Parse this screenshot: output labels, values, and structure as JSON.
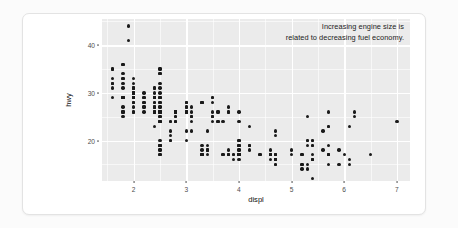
{
  "chart_data": {
    "type": "scatter",
    "title": "",
    "xlabel": "displ",
    "ylabel": "hwy",
    "xlim": [
      1.4,
      7.25
    ],
    "ylim": [
      11.5,
      45.5
    ],
    "xticks": [
      2,
      3,
      4,
      5,
      6,
      7
    ],
    "yticks": [
      20,
      30,
      40
    ],
    "xtick_labels": [
      "2",
      "3",
      "4",
      "5",
      "6",
      "7"
    ],
    "ytick_labels": [
      "20",
      "30",
      "40"
    ],
    "grid": true,
    "grid_major_color": "#ffffff",
    "panel_color": "#ebebeb",
    "point_color": "#1a1a1a",
    "legend": "none",
    "annotations": [
      {
        "text_line1": "Increasing engine size is",
        "text_line2": "related to decreasing fuel economy.",
        "position": "top-right"
      }
    ],
    "points": [
      [
        1.8,
        29
      ],
      [
        1.8,
        29
      ],
      [
        2.0,
        31
      ],
      [
        2.0,
        30
      ],
      [
        2.8,
        26
      ],
      [
        2.8,
        26
      ],
      [
        3.1,
        27
      ],
      [
        1.8,
        26
      ],
      [
        1.8,
        25
      ],
      [
        2.0,
        28
      ],
      [
        2.0,
        27
      ],
      [
        2.8,
        25
      ],
      [
        2.8,
        25
      ],
      [
        3.1,
        25
      ],
      [
        3.1,
        25
      ],
      [
        2.8,
        24
      ],
      [
        3.1,
        25
      ],
      [
        4.2,
        23
      ],
      [
        5.3,
        20
      ],
      [
        5.3,
        15
      ],
      [
        5.3,
        20
      ],
      [
        5.7,
        17
      ],
      [
        6.0,
        17
      ],
      [
        5.7,
        26
      ],
      [
        5.7,
        23
      ],
      [
        6.2,
        26
      ],
      [
        6.2,
        25
      ],
      [
        7.0,
        24
      ],
      [
        5.3,
        19
      ],
      [
        5.3,
        14
      ],
      [
        5.7,
        15
      ],
      [
        6.5,
        17
      ],
      [
        2.4,
        27
      ],
      [
        2.4,
        26
      ],
      [
        3.1,
        22
      ],
      [
        3.5,
        25
      ],
      [
        3.6,
        24
      ],
      [
        2.4,
        23
      ],
      [
        3.0,
        20
      ],
      [
        3.3,
        18
      ],
      [
        3.3,
        19
      ],
      [
        3.3,
        17
      ],
      [
        3.3,
        17
      ],
      [
        3.3,
        17
      ],
      [
        3.8,
        18
      ],
      [
        3.8,
        17
      ],
      [
        3.8,
        17
      ],
      [
        4.0,
        16
      ],
      [
        3.7,
        17
      ],
      [
        3.7,
        17
      ],
      [
        3.9,
        17
      ],
      [
        3.9,
        17
      ],
      [
        4.7,
        16
      ],
      [
        4.7,
        17
      ],
      [
        4.7,
        16
      ],
      [
        5.2,
        15
      ],
      [
        5.2,
        14
      ],
      [
        3.9,
        16
      ],
      [
        4.7,
        16
      ],
      [
        4.7,
        15
      ],
      [
        4.7,
        16
      ],
      [
        5.2,
        15
      ],
      [
        5.7,
        17
      ],
      [
        5.9,
        15
      ],
      [
        4.7,
        16
      ],
      [
        4.7,
        16
      ],
      [
        4.7,
        16
      ],
      [
        4.7,
        16
      ],
      [
        4.7,
        16
      ],
      [
        4.7,
        17
      ],
      [
        5.2,
        17
      ],
      [
        5.2,
        17
      ],
      [
        5.7,
        19
      ],
      [
        5.9,
        18
      ],
      [
        4.6,
        17
      ],
      [
        5.4,
        17
      ],
      [
        5.4,
        16
      ],
      [
        4.0,
        17
      ],
      [
        4.0,
        17
      ],
      [
        4.6,
        16
      ],
      [
        5.0,
        17
      ],
      [
        4.2,
        19
      ],
      [
        4.2,
        19
      ],
      [
        4.6,
        17
      ],
      [
        4.6,
        17
      ],
      [
        4.6,
        17
      ],
      [
        5.4,
        16
      ],
      [
        5.4,
        16
      ],
      [
        5.4,
        16
      ],
      [
        4.0,
        17
      ],
      [
        4.0,
        18
      ],
      [
        1.6,
        33
      ],
      [
        1.6,
        32
      ],
      [
        1.6,
        32
      ],
      [
        1.6,
        29
      ],
      [
        1.6,
        32
      ],
      [
        1.8,
        34
      ],
      [
        1.8,
        36
      ],
      [
        1.8,
        36
      ],
      [
        2.0,
        29
      ],
      [
        2.4,
        26
      ],
      [
        2.4,
        27
      ],
      [
        2.4,
        30
      ],
      [
        2.4,
        31
      ],
      [
        2.5,
        26
      ],
      [
        2.5,
        26
      ],
      [
        3.3,
        28
      ],
      [
        2.0,
        26
      ],
      [
        2.0,
        29
      ],
      [
        2.0,
        29
      ],
      [
        2.0,
        29
      ],
      [
        2.7,
        24
      ],
      [
        2.7,
        24
      ],
      [
        2.7,
        22
      ],
      [
        3.0,
        22
      ],
      [
        3.7,
        24
      ],
      [
        4.0,
        24
      ],
      [
        4.7,
        17
      ],
      [
        4.7,
        22
      ],
      [
        4.7,
        21
      ],
      [
        5.7,
        23
      ],
      [
        6.1,
        23
      ],
      [
        4.0,
        19
      ],
      [
        4.2,
        18
      ],
      [
        4.4,
        17
      ],
      [
        4.6,
        17
      ],
      [
        5.4,
        19
      ],
      [
        5.4,
        19
      ],
      [
        5.4,
        12
      ],
      [
        2.5,
        17
      ],
      [
        2.5,
        18
      ],
      [
        2.5,
        19
      ],
      [
        2.5,
        19
      ],
      [
        2.5,
        20
      ],
      [
        2.5,
        17
      ],
      [
        2.5,
        18
      ],
      [
        2.5,
        19
      ],
      [
        2.5,
        19
      ],
      [
        3.3,
        17
      ],
      [
        3.3,
        17
      ],
      [
        4.0,
        17
      ],
      [
        5.6,
        22
      ],
      [
        3.1,
        24
      ],
      [
        3.8,
        17
      ],
      [
        3.8,
        17
      ],
      [
        4.0,
        17
      ],
      [
        2.5,
        26
      ],
      [
        1.8,
        26
      ],
      [
        1.8,
        26
      ],
      [
        1.8,
        27
      ],
      [
        2.0,
        28
      ],
      [
        2.0,
        29
      ],
      [
        2.0,
        29
      ],
      [
        2.0,
        28
      ],
      [
        2.8,
        26
      ],
      [
        2.8,
        26
      ],
      [
        3.6,
        26
      ],
      [
        2.4,
        29
      ],
      [
        2.4,
        29
      ],
      [
        2.4,
        29
      ],
      [
        2.5,
        28
      ],
      [
        2.4,
        29
      ],
      [
        2.4,
        29
      ],
      [
        2.5,
        28
      ],
      [
        3.5,
        29
      ],
      [
        3.5,
        29
      ],
      [
        3.0,
        28
      ],
      [
        3.0,
        28
      ],
      [
        3.5,
        28
      ],
      [
        3.3,
        28
      ],
      [
        3.3,
        28
      ],
      [
        4.0,
        26
      ],
      [
        5.6,
        18
      ],
      [
        3.1,
        26
      ],
      [
        3.8,
        26
      ],
      [
        3.8,
        26
      ],
      [
        3.8,
        27
      ],
      [
        5.3,
        25
      ],
      [
        2.5,
        25
      ],
      [
        2.5,
        26
      ],
      [
        2.5,
        26
      ],
      [
        2.5,
        27
      ],
      [
        2.5,
        27
      ],
      [
        2.5,
        26
      ],
      [
        2.2,
        27
      ],
      [
        2.2,
        26
      ],
      [
        2.4,
        27
      ],
      [
        2.4,
        26
      ],
      [
        3.0,
        26
      ],
      [
        3.0,
        26
      ],
      [
        3.5,
        24
      ],
      [
        2.2,
        27
      ],
      [
        2.2,
        30
      ],
      [
        2.4,
        31
      ],
      [
        2.4,
        26
      ],
      [
        3.0,
        26
      ],
      [
        3.0,
        28
      ],
      [
        3.5,
        26
      ],
      [
        1.8,
        31
      ],
      [
        1.8,
        33
      ],
      [
        2.0,
        30
      ],
      [
        2.0,
        29
      ],
      [
        2.8,
        24
      ],
      [
        2.8,
        24
      ],
      [
        3.6,
        24
      ],
      [
        1.9,
        44
      ],
      [
        2.0,
        29
      ],
      [
        2.0,
        26
      ],
      [
        2.0,
        29
      ],
      [
        2.5,
        29
      ],
      [
        2.5,
        29
      ],
      [
        1.8,
        29
      ],
      [
        1.8,
        29
      ],
      [
        1.8,
        29
      ],
      [
        2.0,
        30
      ],
      [
        2.0,
        31
      ],
      [
        2.8,
        26
      ],
      [
        2.8,
        26
      ],
      [
        3.6,
        26
      ],
      [
        1.9,
        41
      ],
      [
        2.0,
        33
      ],
      [
        2.0,
        32
      ],
      [
        2.5,
        35
      ],
      [
        2.5,
        34
      ],
      [
        2.5,
        34
      ],
      [
        2.5,
        35
      ],
      [
        2.5,
        32
      ],
      [
        2.5,
        31
      ],
      [
        2.2,
        28
      ],
      [
        2.2,
        28
      ],
      [
        2.4,
        28
      ],
      [
        2.4,
        28
      ],
      [
        3.0,
        26
      ],
      [
        3.0,
        26
      ],
      [
        3.5,
        25
      ],
      [
        2.7,
        20
      ],
      [
        2.7,
        20
      ],
      [
        2.7,
        21
      ],
      [
        3.4,
        22
      ],
      [
        3.4,
        18
      ],
      [
        4.0,
        18
      ],
      [
        4.7,
        17
      ],
      [
        2.2,
        29
      ],
      [
        2.2,
        29
      ],
      [
        2.4,
        29
      ],
      [
        2.4,
        29
      ],
      [
        3.0,
        27
      ],
      [
        3.0,
        27
      ],
      [
        3.5,
        25
      ],
      [
        4.0,
        20
      ],
      [
        4.0,
        19
      ],
      [
        4.6,
        18
      ],
      [
        5.0,
        18
      ],
      [
        4.2,
        19
      ],
      [
        4.4,
        17
      ],
      [
        4.6,
        17
      ],
      [
        5.4,
        20
      ],
      [
        5.4,
        20
      ],
      [
        4.0,
        20
      ],
      [
        4.0,
        19
      ],
      [
        1.6,
        35
      ],
      [
        1.6,
        35
      ],
      [
        1.6,
        31
      ],
      [
        1.8,
        33
      ],
      [
        1.8,
        32
      ],
      [
        2.0,
        31
      ],
      [
        2.0,
        30
      ],
      [
        2.0,
        30
      ],
      [
        2.4,
        29
      ],
      [
        2.4,
        29
      ],
      [
        2.5,
        30
      ],
      [
        2.5,
        29
      ],
      [
        2.8,
        26
      ],
      [
        2.8,
        26
      ],
      [
        3.4,
        19
      ],
      [
        3.4,
        18
      ],
      [
        3.4,
        18
      ],
      [
        3.4,
        17
      ],
      [
        4.0,
        17
      ],
      [
        4.0,
        17
      ],
      [
        4.7,
        15
      ],
      [
        4.7,
        16
      ],
      [
        4.7,
        16
      ],
      [
        5.7,
        17
      ],
      [
        5.7,
        17
      ],
      [
        6.1,
        16
      ],
      [
        6.1,
        15
      ],
      [
        2.5,
        26
      ],
      [
        2.5,
        25
      ],
      [
        2.5,
        24
      ],
      [
        2.5,
        24
      ],
      [
        2.5,
        24
      ],
      [
        2.5,
        24
      ]
    ]
  }
}
